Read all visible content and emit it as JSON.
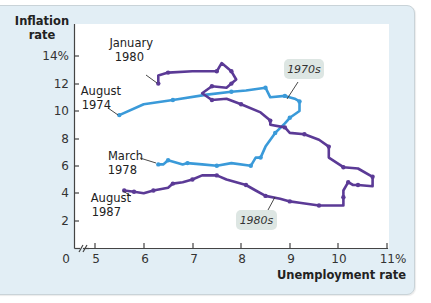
{
  "chart_data": {
    "type": "line",
    "title": "",
    "xlabel": "Unemployment rate",
    "ylabel": "Inflation rate",
    "xlim": [
      0,
      11
    ],
    "ylim": [
      0,
      14
    ],
    "x_axis_break": true,
    "grid": false,
    "x_ticks": [
      "0",
      "5",
      "6",
      "7",
      "8",
      "9",
      "10",
      "11%"
    ],
    "y_ticks": [
      "0",
      "2",
      "4",
      "6",
      "8",
      "10",
      "12",
      "14%"
    ],
    "colors": {
      "1970s": "#3a9ad9",
      "1980s": "#5b3a96",
      "panel": "#e2eef5",
      "bubble": "#dfe7e4"
    },
    "series": [
      {
        "name": "1970s",
        "color": "#3a9ad9",
        "points": [
          [
            5.5,
            9.7
          ],
          [
            6.0,
            10.5
          ],
          [
            6.6,
            10.8
          ],
          [
            7.3,
            11.2
          ],
          [
            7.8,
            11.4
          ],
          [
            8.1,
            11.5
          ],
          [
            8.5,
            11.7
          ],
          [
            8.6,
            11.0
          ],
          [
            8.9,
            11.1
          ],
          [
            9.1,
            10.9
          ],
          [
            9.2,
            10.7
          ],
          [
            9.2,
            10.0
          ],
          [
            9.0,
            9.5
          ],
          [
            8.9,
            9.1
          ],
          [
            8.7,
            8.4
          ],
          [
            8.5,
            7.4
          ],
          [
            8.4,
            6.6
          ],
          [
            8.3,
            6.6
          ],
          [
            8.2,
            6.0
          ],
          [
            7.8,
            6.2
          ],
          [
            7.5,
            6.0
          ],
          [
            7.2,
            6.1
          ],
          [
            6.9,
            6.2
          ],
          [
            6.8,
            6.1
          ],
          [
            6.5,
            6.4
          ],
          [
            6.4,
            6.1
          ],
          [
            6.3,
            6.1
          ]
        ],
        "start_label": "August 1974",
        "end_label": "March 1978",
        "bubble_label": "1970s"
      },
      {
        "name": "1980s",
        "color": "#5b3a96",
        "points": [
          [
            6.3,
            12.0
          ],
          [
            6.3,
            12.6
          ],
          [
            6.5,
            12.8
          ],
          [
            7.0,
            12.9
          ],
          [
            7.5,
            12.9
          ],
          [
            7.6,
            13.5
          ],
          [
            7.8,
            12.9
          ],
          [
            7.9,
            12.3
          ],
          [
            7.8,
            12.0
          ],
          [
            7.7,
            11.7
          ],
          [
            7.4,
            11.8
          ],
          [
            7.2,
            11.3
          ],
          [
            7.4,
            10.8
          ],
          [
            7.7,
            10.9
          ],
          [
            8.0,
            10.5
          ],
          [
            8.4,
            9.9
          ],
          [
            8.6,
            9.3
          ],
          [
            8.6,
            9.0
          ],
          [
            8.9,
            8.8
          ],
          [
            9.0,
            8.4
          ],
          [
            9.3,
            8.3
          ],
          [
            9.6,
            7.9
          ],
          [
            9.8,
            7.4
          ],
          [
            9.8,
            6.6
          ],
          [
            10.1,
            5.9
          ],
          [
            10.4,
            5.8
          ],
          [
            10.7,
            5.2
          ],
          [
            10.7,
            4.5
          ],
          [
            10.4,
            4.6
          ],
          [
            10.3,
            4.6
          ],
          [
            10.2,
            4.8
          ],
          [
            10.1,
            4.2
          ],
          [
            10.1,
            3.7
          ],
          [
            10.1,
            3.1
          ],
          [
            9.6,
            3.1
          ],
          [
            9.2,
            3.3
          ],
          [
            9.0,
            3.4
          ],
          [
            8.8,
            3.6
          ],
          [
            8.5,
            3.8
          ],
          [
            8.3,
            4.2
          ],
          [
            8.1,
            4.6
          ],
          [
            7.7,
            5.0
          ],
          [
            7.5,
            5.3
          ],
          [
            7.2,
            5.3
          ],
          [
            7.0,
            5.0
          ],
          [
            6.8,
            4.8
          ],
          [
            6.6,
            4.7
          ],
          [
            6.5,
            4.4
          ],
          [
            6.2,
            4.2
          ],
          [
            6.0,
            4.0
          ],
          [
            5.8,
            4.1
          ],
          [
            5.6,
            4.2
          ]
        ],
        "start_label": "January 1980",
        "end_label": "August 1987",
        "bubble_label": "1980s"
      }
    ],
    "annotations": [
      {
        "text": "January 1980",
        "at": [
          6.3,
          12.0
        ]
      },
      {
        "text": "August 1974",
        "at": [
          5.5,
          9.7
        ]
      },
      {
        "text": "March 1978",
        "at": [
          6.3,
          6.1
        ]
      },
      {
        "text": "August 1987",
        "at": [
          5.6,
          4.2
        ]
      },
      {
        "text": "1970s",
        "type": "bubble"
      },
      {
        "text": "1980s",
        "type": "bubble"
      }
    ]
  },
  "labels": {
    "y_title_line1": "Inflation",
    "y_title_line2": "rate",
    "x_title": "Unemployment rate",
    "jan1980_line1": "January",
    "jan1980_line2": "1980",
    "aug1974_line1": "August",
    "aug1974_line2": "1974",
    "mar1978_line1": "March",
    "mar1978_line2": "1978",
    "aug1987_line1": "August",
    "aug1987_line2": "1987",
    "bubble_1970s": "1970s",
    "bubble_1980s": "1980s"
  }
}
